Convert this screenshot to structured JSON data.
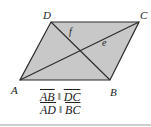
{
  "figure": {
    "shape": "parallelogram",
    "fill_color": "#c8c8c8",
    "stroke_color": "#2a2a2a",
    "vertices": {
      "A": {
        "label": "A",
        "x": 20,
        "y": 80
      },
      "B": {
        "label": "B",
        "x": 110,
        "y": 80
      },
      "C": {
        "label": "C",
        "x": 139,
        "y": 22
      },
      "D": {
        "label": "D",
        "x": 51,
        "y": 22
      }
    },
    "diagonals": [
      {
        "from": "A",
        "to": "C",
        "label": "e"
      },
      {
        "from": "D",
        "to": "B",
        "label": "f"
      }
    ]
  },
  "labels": {
    "A": "A",
    "B": "B",
    "C": "C",
    "D": "D",
    "e": "e",
    "f": "f"
  },
  "statements": [
    {
      "left": "AB",
      "symbol": "‖",
      "right": "DC"
    },
    {
      "left": "AD",
      "symbol": "‖",
      "right": "BC"
    }
  ]
}
